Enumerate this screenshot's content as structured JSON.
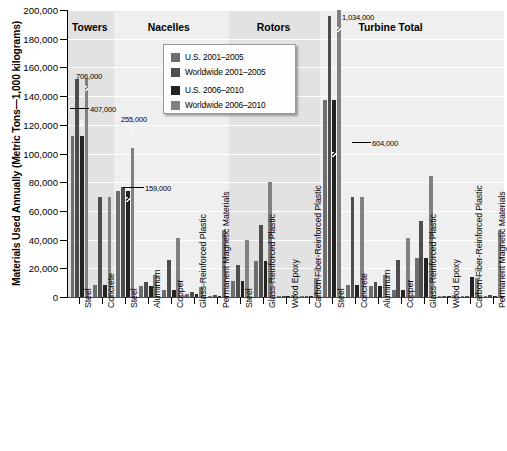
{
  "chart_data": {
    "type": "bar",
    "title": "",
    "xlabel": "",
    "ylabel": "Materials Used Annually (Metric Tons—1,000 kilograms)",
    "ylim": [
      0,
      200000
    ],
    "ytick_labels": [
      "200,000",
      "180,000",
      "160,000",
      "140,000",
      "120,000",
      "100,000",
      "80,000",
      "60,000",
      "40,000",
      "20,000",
      "0"
    ],
    "ytick_values": [
      200000,
      180000,
      160000,
      140000,
      120000,
      100000,
      80000,
      60000,
      40000,
      20000,
      0
    ],
    "grid": true,
    "legend_position": "upper-center",
    "series": [
      {
        "name": "U.S. 2001–2005",
        "color": "#6e6e6e"
      },
      {
        "name": "Worldwide 2001–2005",
        "color": "#4d4d4d"
      },
      {
        "name": "U.S. 2006–2010",
        "color": "#232323"
      },
      {
        "name": "Worldwide 2006–2010",
        "color": "#808080"
      }
    ],
    "groups": [
      {
        "label": "Towers",
        "categories": [
          "Steel",
          "Concrete"
        ]
      },
      {
        "label": "Nacelles",
        "categories": [
          "Steel",
          "Aluminum",
          "Copper",
          "Glass-Reinforced Plastic",
          "Permanent Magnetic Materials"
        ]
      },
      {
        "label": "Rotors",
        "categories": [
          "Steel",
          "Glass-Reinforced Plastic",
          "Wood Epoxy",
          "Carbon-Fiber-Reinforced Plastic"
        ]
      },
      {
        "label": "Turbine Total",
        "categories": [
          "Steel",
          "Concrete",
          "Aluminum",
          "Copper",
          "Glass-Reinforced Plastic",
          "Wood Epoxy",
          "Carbon-Fiber-Reinforced Plastic",
          "Permanent Magnetic Materials"
        ]
      }
    ],
    "categories": [
      "Steel",
      "Concrete",
      "Steel",
      "Aluminum",
      "Copper",
      "Glass-Reinforced Plastic",
      "Permanent Magnetic Materials",
      "Steel",
      "Glass-Reinforced Plastic",
      "Wood Epoxy",
      "Carbon-Fiber-Reinforced Plastic",
      "Steel",
      "Concrete",
      "Aluminum",
      "Copper",
      "Glass-Reinforced Plastic",
      "Wood Epoxy",
      "Carbon-Fiber-Reinforced Plastic",
      "Permanent Magnetic Materials"
    ],
    "values": {
      "U.S. 2001–2005": [
        112000,
        8600,
        74000,
        8000,
        4600,
        1800,
        600,
        11500,
        25000,
        700,
        500,
        137000,
        8600,
        8000,
        4600,
        27000,
        700,
        500,
        600
      ],
      "Worldwide 2001–2005": [
        152000,
        70000,
        77000,
        10500,
        25500,
        3500,
        1200,
        22500,
        50000,
        900,
        900,
        196000,
        70000,
        10500,
        25500,
        53000,
        900,
        900,
        1200
      ],
      "U.S. 2006–2010": [
        112000,
        8600,
        74000,
        8000,
        4600,
        1800,
        600,
        11500,
        25000,
        700,
        500,
        137000,
        8600,
        8000,
        4600,
        27000,
        700,
        14000,
        600
      ],
      "Worldwide 2006–2010": [
        152000,
        70000,
        104000,
        15500,
        41000,
        7000,
        46500,
        40000,
        80000,
        1500,
        13500,
        200000,
        69500,
        15500,
        41000,
        84000,
        1500,
        13500,
        46500
      ]
    },
    "annotations": [
      {
        "text": "706,000",
        "category_index": 0,
        "series": "Worldwide 2006–2010",
        "note": "bar broken above axis max"
      },
      {
        "text": "407,000",
        "category_index": 0,
        "series": "U.S. 2006–2010",
        "note": "bar broken above axis max"
      },
      {
        "text": "255,000",
        "category_index": 2,
        "series": "Worldwide 2006–2010",
        "note": "bar broken above axis max"
      },
      {
        "text": "159,000",
        "category_index": 2,
        "series": "U.S. 2006–2010",
        "note": "bar broken above axis max"
      },
      {
        "text": "1,034,000",
        "category_index": 11,
        "series": "Worldwide 2006–2010",
        "note": "bar broken above axis max"
      },
      {
        "text": "604,000",
        "category_index": 11,
        "series": "U.S. 2006–2010",
        "note": "bar broken above axis max"
      }
    ]
  }
}
